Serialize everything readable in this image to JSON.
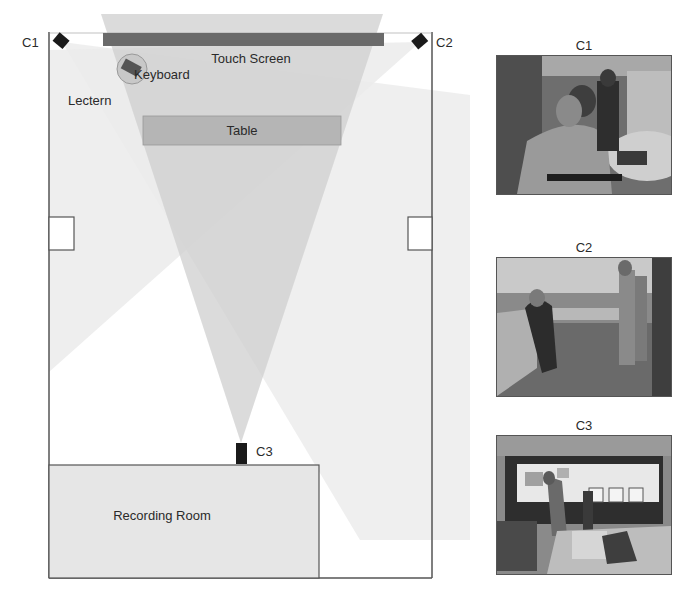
{
  "figure": {
    "cameras": [
      {
        "id": "c1",
        "label": "C1"
      },
      {
        "id": "c2",
        "label": "C2"
      },
      {
        "id": "c3",
        "label": "C3"
      }
    ],
    "objects": {
      "touch_screen": "Touch Screen",
      "keyboard": "Keyboard",
      "lectern": "Lectern",
      "table": "Table",
      "recording_room": "Recording Room"
    },
    "camera_views": [
      {
        "label": "C1",
        "description": "View from camera C1: person at lectern using keyboard in front of touch screen"
      },
      {
        "label": "C2",
        "description": "View from camera C2: people standing near tables and touch screen wall"
      },
      {
        "label": "C3",
        "description": "View from camera C3: wide view of touch screen wall with people interacting"
      }
    ]
  },
  "colors": {
    "wall": "#555555",
    "screen": "#6a6a6a",
    "cone_c3": "#d4d4d4",
    "cone_side": "#ececec",
    "table": "#b5b5b5",
    "room": "#e6e6e6",
    "camera": "#1a1a1a"
  }
}
